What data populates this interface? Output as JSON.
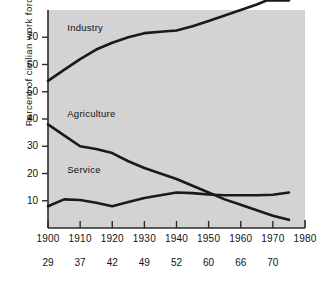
{
  "chart_data": {
    "type": "line",
    "title": "",
    "xlabel": "",
    "ylabel": "Percent of civilian work force",
    "xlim": [
      1900,
      1980
    ],
    "ylim": [
      0,
      80
    ],
    "grid": false,
    "legend_position": "inline-labels",
    "xticks": [
      1900,
      1910,
      1920,
      1930,
      1940,
      1950,
      1960,
      1970,
      1980
    ],
    "xtick_labels": [
      "1900",
      "1910",
      "1920",
      "1930",
      "1940",
      "1950",
      "1960",
      "1970",
      "1980"
    ],
    "xtick_labels_secondary": [
      "29",
      "37",
      "42",
      "49",
      "52",
      "60",
      "66",
      "70"
    ],
    "yticks": [
      10,
      20,
      30,
      40,
      50,
      60,
      70
    ],
    "ytick_labels": [
      "10",
      "20",
      "30",
      "40",
      "50",
      "60",
      "70"
    ],
    "series": [
      {
        "name": "Industry",
        "label": "Industry",
        "color": "#1a1a1a",
        "x": [
          1900,
          1905,
          1910,
          1915,
          1920,
          1925,
          1930,
          1935,
          1940,
          1945,
          1950,
          1955,
          1960,
          1965,
          1968,
          1970,
          1975
        ],
        "values": [
          54,
          58,
          62,
          65.5,
          68,
          70,
          71.5,
          72,
          72.5,
          74,
          76,
          78,
          80,
          82,
          83.5,
          83.5,
          83.5
        ]
      },
      {
        "name": "Agriculture",
        "label": "Agriculture",
        "color": "#1a1a1a",
        "x": [
          1900,
          1905,
          1910,
          1915,
          1920,
          1925,
          1930,
          1935,
          1940,
          1945,
          1950,
          1955,
          1960,
          1965,
          1970,
          1975
        ],
        "values": [
          38,
          34,
          30,
          29,
          27.5,
          24.5,
          22,
          20,
          18,
          15.5,
          13,
          10.5,
          8.5,
          6.5,
          4.5,
          3
        ]
      },
      {
        "name": "Service",
        "label": "Service",
        "color": "#1a1a1a",
        "x": [
          1900,
          1905,
          1910,
          1915,
          1920,
          1925,
          1930,
          1935,
          1940,
          1945,
          1950,
          1955,
          1960,
          1965,
          1970,
          1975
        ],
        "values": [
          8,
          10.5,
          10.3,
          9.3,
          8,
          9.5,
          11,
          12,
          13,
          12.8,
          12.3,
          12,
          12,
          12,
          12.2,
          13
        ]
      }
    ],
    "series_label_positions": [
      {
        "name": "Industry",
        "x": 1906,
        "y": 73
      },
      {
        "name": "Agriculture",
        "x": 1906,
        "y": 41.5
      },
      {
        "name": "Service",
        "x": 1906,
        "y": 21
      }
    ]
  },
  "style": {
    "plot_background": "#d3d3d3",
    "axis_color": "#2b2b2b",
    "line_color": "#1a1a1a",
    "text_color": "#111111",
    "page_background": "#ffffff"
  }
}
